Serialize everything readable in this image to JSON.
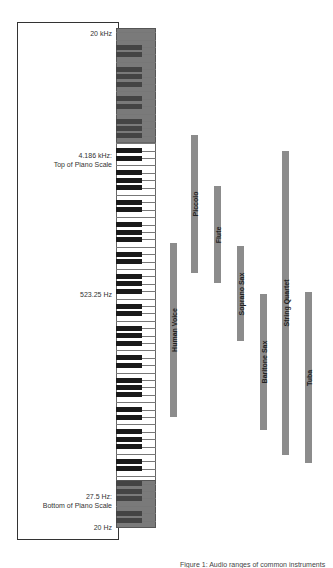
{
  "labels": {
    "top": "20 kHz",
    "piano_top": "4.186 kHz:\nTop of Piano Scale",
    "middle": "523.25 Hz",
    "piano_bottom": "27.5 Hz:\nBottom of Piano Scale",
    "bottom": "20 Hz"
  },
  "instruments": [
    {
      "name": "Human Voice",
      "x": 170,
      "top": 243,
      "bottom": 417
    },
    {
      "name": "Piccolo",
      "x": 191,
      "top": 135,
      "bottom": 273
    },
    {
      "name": "Flute",
      "x": 214,
      "top": 186,
      "bottom": 283
    },
    {
      "name": "Soprano Sax",
      "x": 237,
      "top": 246,
      "bottom": 341
    },
    {
      "name": "Baritone Sax",
      "x": 260,
      "top": 294,
      "bottom": 430
    },
    {
      "name": "String Quartet",
      "x": 282,
      "top": 151,
      "bottom": 455
    },
    {
      "name": "Tuba",
      "x": 305,
      "top": 292,
      "bottom": 463
    }
  ],
  "colors": {
    "bar": "#8c8c8c",
    "extended_range": "#7a7a7a",
    "black_key": "#1a1a1a"
  },
  "caption": "Figure 1: Audio ranges of common instruments"
}
